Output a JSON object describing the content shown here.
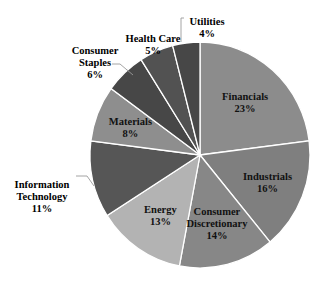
{
  "chart_data": {
    "type": "pie",
    "title": "",
    "start": "top",
    "direction": "clockwise",
    "slices": [
      {
        "label": "Financials",
        "value": 23,
        "display": "23%",
        "color": "#8c8c8c",
        "label_position": "inside"
      },
      {
        "label": "Industrials",
        "value": 16,
        "display": "16%",
        "color": "#7f7f7f",
        "label_position": "inside"
      },
      {
        "label": "Consumer Discretionary",
        "value": 14,
        "display": "14%",
        "color": "#878787",
        "label_position": "inside"
      },
      {
        "label": "Energy",
        "value": 13,
        "display": "13%",
        "color": "#b3b3b3",
        "label_position": "inside"
      },
      {
        "label": "Information Technology",
        "value": 11,
        "display": "11%",
        "color": "#565656",
        "label_position": "outside"
      },
      {
        "label": "Materials",
        "value": 8,
        "display": "8%",
        "color": "#8e8e8e",
        "label_position": "inside"
      },
      {
        "label": "Consumer Staples",
        "value": 6,
        "display": "6%",
        "color": "#474747",
        "label_position": "outside"
      },
      {
        "label": "Health Care",
        "value": 5,
        "display": "5%",
        "color": "#525252",
        "label_position": "outside"
      },
      {
        "label": "Utilities",
        "value": 4,
        "display": "4%",
        "color": "#474747",
        "label_position": "outside"
      }
    ],
    "legend": "none",
    "separator_color": "#ffffff",
    "leader_line_color": "#9a9a9a"
  }
}
